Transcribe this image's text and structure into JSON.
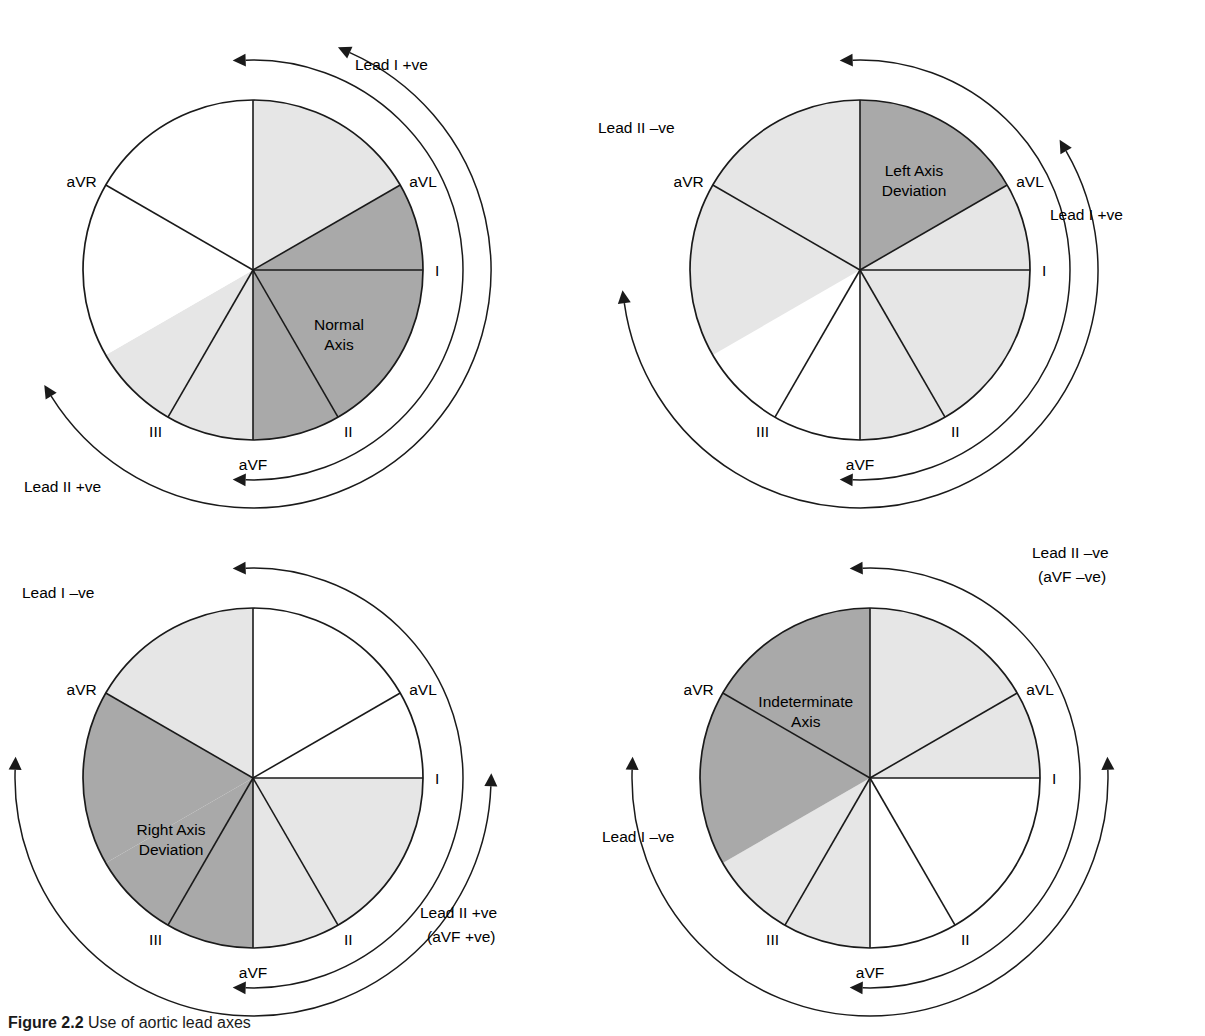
{
  "figure": {
    "caption_number": "Figure 2.2",
    "caption_text": "Use of aortic lead axes"
  },
  "colors": {
    "dark_gray": "#a9a9a9",
    "light_gray": "#e6e6e6",
    "white": "#ffffff",
    "stroke": "#1a1a1a"
  },
  "lead_labels": {
    "I": "I",
    "II": "II",
    "III": "III",
    "aVR": "aVR",
    "aVL": "aVL",
    "aVF": "aVF"
  },
  "panels": [
    {
      "id": "normal-axis",
      "zone_label_lines": [
        "Normal",
        "Axis"
      ],
      "zone_label_angle_deg": 35,
      "zone_label_radius": 105,
      "arc_labels": [
        {
          "id": "lead-1-positive",
          "text": "Lead I +ve",
          "x": 355,
          "y": 62
        },
        {
          "id": "lead-2-positive",
          "text": "Lead II +ve",
          "x": 24,
          "y": 484
        }
      ],
      "sectors": [
        {
          "from": -150,
          "to": -90,
          "fill": "white"
        },
        {
          "from": -90,
          "to": -30,
          "fill": "light_gray"
        },
        {
          "from": -30,
          "to": 0,
          "fill": "dark_gray"
        },
        {
          "from": 0,
          "to": 60,
          "fill": "dark_gray"
        },
        {
          "from": 60,
          "to": 90,
          "fill": "dark_gray"
        },
        {
          "from": 90,
          "to": 120,
          "fill": "light_gray"
        },
        {
          "from": 120,
          "to": 150,
          "fill": "light_gray"
        },
        {
          "from": 150,
          "to": 210,
          "fill": "white"
        }
      ]
    },
    {
      "id": "left-axis-deviation",
      "zone_label_lines": [
        "Left Axis",
        "Deviation"
      ],
      "zone_label_angle_deg": -60,
      "zone_label_radius": 108,
      "arc_labels": [
        {
          "id": "lead-2-negative",
          "text": "Lead II –ve",
          "x": 18,
          "y": 125
        },
        {
          "id": "lead-1-positive",
          "text": "Lead I +ve",
          "x": 470,
          "y": 212
        }
      ],
      "sectors": [
        {
          "from": -150,
          "to": -90,
          "fill": "light_gray"
        },
        {
          "from": -90,
          "to": -30,
          "fill": "dark_gray"
        },
        {
          "from": -30,
          "to": 0,
          "fill": "light_gray"
        },
        {
          "from": 0,
          "to": 60,
          "fill": "light_gray"
        },
        {
          "from": 60,
          "to": 90,
          "fill": "light_gray"
        },
        {
          "from": 90,
          "to": 120,
          "fill": "white"
        },
        {
          "from": 120,
          "to": 150,
          "fill": "white"
        },
        {
          "from": 150,
          "to": 210,
          "fill": "light_gray"
        }
      ]
    },
    {
      "id": "right-axis-deviation",
      "zone_label_lines": [
        "Right Axis",
        "Deviation"
      ],
      "zone_label_angle_deg": 145,
      "zone_label_radius": 100,
      "arc_labels": [
        {
          "id": "lead-1-negative",
          "text": "Lead I –ve",
          "x": 22,
          "y": 78
        },
        {
          "id": "lead-2-positive",
          "text": "Lead II +ve",
          "x": 420,
          "y": 398
        },
        {
          "id": "lead-2-positive-sub",
          "text": "(aVF +ve)",
          "x": 427,
          "y": 422
        }
      ],
      "sectors": [
        {
          "from": -150,
          "to": -90,
          "fill": "light_gray"
        },
        {
          "from": -90,
          "to": -30,
          "fill": "white"
        },
        {
          "from": -30,
          "to": 0,
          "fill": "white"
        },
        {
          "from": 0,
          "to": 60,
          "fill": "light_gray"
        },
        {
          "from": 60,
          "to": 90,
          "fill": "light_gray"
        },
        {
          "from": 90,
          "to": 120,
          "fill": "dark_gray"
        },
        {
          "from": 120,
          "to": 150,
          "fill": "dark_gray"
        },
        {
          "from": 150,
          "to": 210,
          "fill": "dark_gray"
        }
      ]
    },
    {
      "id": "indeterminate-axis",
      "zone_label_lines": [
        "Indeterminate",
        "Axis"
      ],
      "zone_label_angle_deg": -132,
      "zone_label_radius": 96,
      "arc_labels": [
        {
          "id": "lead-2-negative",
          "text": "Lead II –ve",
          "x": 452,
          "y": 38
        },
        {
          "id": "lead-2-negative-sub",
          "text": "(aVF –ve)",
          "x": 458,
          "y": 62
        },
        {
          "id": "lead-1-negative",
          "text": "Lead I –ve",
          "x": 22,
          "y": 322
        }
      ],
      "sectors": [
        {
          "from": -150,
          "to": -90,
          "fill": "dark_gray"
        },
        {
          "from": -90,
          "to": -30,
          "fill": "light_gray"
        },
        {
          "from": -30,
          "to": 0,
          "fill": "light_gray"
        },
        {
          "from": 0,
          "to": 60,
          "fill": "white"
        },
        {
          "from": 60,
          "to": 90,
          "fill": "white"
        },
        {
          "from": 90,
          "to": 120,
          "fill": "light_gray"
        },
        {
          "from": 120,
          "to": 150,
          "fill": "light_gray"
        },
        {
          "from": 150,
          "to": 210,
          "fill": "dark_gray"
        }
      ]
    }
  ]
}
